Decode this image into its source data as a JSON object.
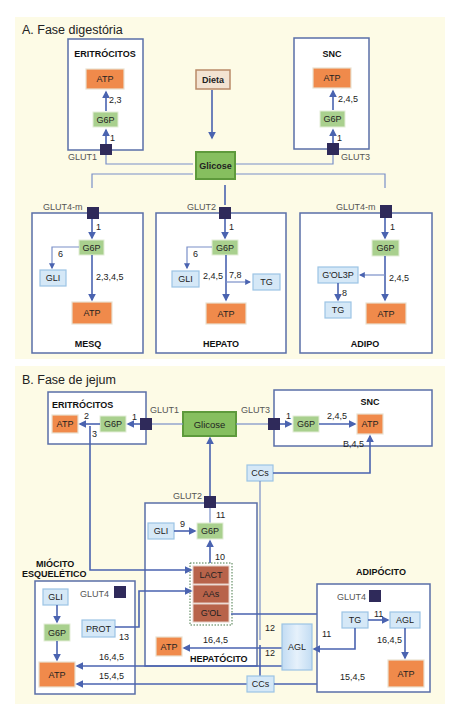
{
  "panel_a": {
    "title": "A. Fase digestória",
    "cells": {
      "eritrocitos": {
        "label": "ERITRÓCITOS",
        "glut": "GLUT1",
        "atp": "ATP",
        "g6p": "G6P",
        "step_in": "1",
        "step_atp": "2,3"
      },
      "snc": {
        "label": "SNC",
        "glut": "GLUT3",
        "atp": "ATP",
        "g6p": "G6P",
        "step_in": "1",
        "step_atp": "2,4,5"
      },
      "mesq": {
        "label": "MESQ",
        "glut": "GLUT4-m",
        "g6p": "G6P",
        "gli": "GLI",
        "atp": "ATP",
        "step_in": "1",
        "step_gli": "6",
        "step_atp": "2,3,4,5"
      },
      "hepato": {
        "label": "HEPATO",
        "glut": "GLUT2",
        "g6p": "G6P",
        "gli": "GLI",
        "tg": "TG",
        "atp": "ATP",
        "step_in": "1",
        "step_gli": "6",
        "step_atp": "2,4,5",
        "step_tg": "7,8"
      },
      "adipo": {
        "label": "ADIPO",
        "glut": "GLUT4-m",
        "g6p": "G6P",
        "gol3p": "G'OL3P",
        "tg": "TG",
        "atp": "ATP",
        "step_in": "1",
        "step_atp": "2,4,5",
        "step_tg": "8"
      }
    },
    "dieta": "Dieta",
    "glicose": "Glicose"
  },
  "panel_b": {
    "title": "B. Fase de jejum",
    "glicose": "Glicose",
    "eritrocitos": {
      "label": "ERITRÓCITOS",
      "glut": "GLUT1",
      "atp": "ATP",
      "g6p": "G6P",
      "step_in": "1",
      "step_atp": "2",
      "step_lact": "3"
    },
    "snc": {
      "label": "SNC",
      "glut": "GLUT3",
      "g6p": "G6P",
      "atp": "ATP",
      "step_in": "1",
      "step_atp": "2,4,5",
      "step_ccs": "B,4,5"
    },
    "ccs_top": "CCs",
    "hepatocito": {
      "label": "HEPATÓCITO",
      "glut": "GLUT2",
      "gli": "GLI",
      "g6p": "G6P",
      "step_gli": "9",
      "step_out": "11",
      "step_gng": "10",
      "substrates": [
        "LACT",
        "AAs",
        "G'OL"
      ],
      "atp": "ATP",
      "step_atp": "16,4,5",
      "step_ccs_a": "12",
      "step_ccs_b": "12"
    },
    "miocito": {
      "label_1": "MIÓCITO",
      "label_2": "ESQUELÉTICO",
      "glut": "GLUT4",
      "gli": "GLI",
      "g6p": "G6P",
      "prot": "PROT",
      "step_prot": "13",
      "atp": "ATP",
      "step_agl": "16,4,5",
      "step_ccs": "15,4,5"
    },
    "adipocito": {
      "label": "ADIPÓCITO",
      "glut": "GLUT4",
      "tg": "TG",
      "agl": "AGL",
      "atp": "ATP",
      "step_tg_agl": "11",
      "step_agl_atp": "16,4,5",
      "step_ccs": "15,4,5",
      "step_release": "11"
    },
    "agl_blood": "AGL",
    "ccs_bottom": "CCs"
  },
  "colors": {
    "panel_bg": "#fdfbe6",
    "line": "#4a63b0",
    "atp": "#f08a4b",
    "g6p": "#a9d08e",
    "glicose": "#86bf5f",
    "metabolite": "#d5e8f7",
    "transporter": "#2f2a5a"
  }
}
